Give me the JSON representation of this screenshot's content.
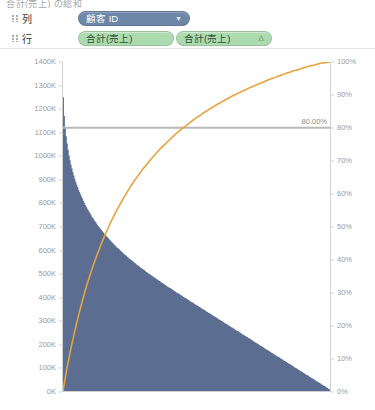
{
  "top_caption": "合計(売上) の総和",
  "shelves": {
    "columns": {
      "label": "列",
      "pills": [
        {
          "text": "顧客 ID",
          "cap": "▼",
          "kind": "blue"
        }
      ]
    },
    "rows": {
      "label": "行",
      "pills": [
        {
          "text": "合計(売上)",
          "cap": "",
          "kind": "green"
        },
        {
          "text": "合計(売上)",
          "cap": "△",
          "kind": "green"
        }
      ]
    }
  },
  "colors": {
    "bar": "#5b6e91",
    "line": "#e8a33d",
    "reference_line": "#b9b9b9",
    "axis_text": "#9a9a9a",
    "pill_blue": "#6e87a8",
    "pill_green": "#addbb0"
  },
  "chart_data": {
    "type": "bar",
    "title": "",
    "subtitle": "",
    "xlabel": "顧客 ID",
    "ylabel": "売上",
    "y2label": "売上の合計の累計(%)",
    "grid": false,
    "legend": "none",
    "ylim": [
      0,
      1400000
    ],
    "y2lim": [
      0,
      1.0
    ],
    "y_ticks": [
      "0K",
      "100K",
      "200K",
      "300K",
      "400K",
      "500K",
      "600K",
      "700K",
      "800K",
      "900K",
      "1000K",
      "1100K",
      "1200K",
      "1300K",
      "1400K"
    ],
    "y_tick_values": [
      0,
      100000,
      200000,
      300000,
      400000,
      500000,
      600000,
      700000,
      800000,
      900000,
      1000000,
      1100000,
      1200000,
      1300000,
      1400000
    ],
    "y2_ticks": [
      "0%",
      "10%",
      "20%",
      "30%",
      "40%",
      "50%",
      "60%",
      "70%",
      "80%",
      "90%",
      "100%"
    ],
    "y2_tick_values": [
      0,
      10,
      20,
      30,
      40,
      50,
      60,
      70,
      80,
      90,
      100
    ],
    "annotations": [
      {
        "text": "80.00%",
        "type": "reference-line",
        "axis": "y2",
        "value": 80
      }
    ],
    "series": [
      {
        "name": "売上",
        "type": "bar",
        "axis": "y",
        "note": "Descending Pareto profile of per-customer sales, normalized 0-1 of max 1400K",
        "values_normalized": [
          0.893,
          0.836,
          0.8,
          0.774,
          0.752,
          0.733,
          0.716,
          0.701,
          0.688,
          0.676,
          0.665,
          0.655,
          0.645,
          0.636,
          0.628,
          0.62,
          0.612,
          0.605,
          0.598,
          0.591,
          0.585,
          0.578,
          0.572,
          0.566,
          0.561,
          0.555,
          0.55,
          0.545,
          0.54,
          0.535,
          0.53,
          0.526,
          0.521,
          0.517,
          0.513,
          0.508,
          0.504,
          0.5,
          0.497,
          0.493,
          0.489,
          0.485,
          0.482,
          0.478,
          0.475,
          0.471,
          0.468,
          0.465,
          0.461,
          0.458,
          0.455,
          0.452,
          0.449,
          0.446,
          0.443,
          0.44,
          0.437,
          0.435,
          0.432,
          0.429,
          0.426,
          0.424,
          0.421,
          0.418,
          0.416,
          0.413,
          0.411,
          0.408,
          0.406,
          0.403,
          0.401,
          0.398,
          0.396,
          0.394,
          0.391,
          0.389,
          0.387,
          0.384,
          0.382,
          0.38,
          0.378,
          0.375,
          0.373,
          0.371,
          0.369,
          0.367,
          0.365,
          0.362,
          0.36,
          0.358,
          0.356,
          0.354,
          0.352,
          0.35,
          0.348,
          0.346,
          0.344,
          0.342,
          0.34,
          0.338,
          0.336,
          0.334,
          0.332,
          0.33,
          0.328,
          0.326,
          0.324,
          0.322,
          0.32,
          0.318,
          0.316,
          0.314,
          0.313,
          0.311,
          0.309,
          0.307,
          0.305,
          0.303,
          0.301,
          0.299,
          0.297,
          0.296,
          0.294,
          0.292,
          0.29,
          0.288,
          0.286,
          0.284,
          0.283,
          0.281,
          0.279,
          0.277,
          0.275,
          0.273,
          0.271,
          0.27,
          0.268,
          0.266,
          0.264,
          0.262,
          0.26,
          0.259,
          0.257,
          0.255,
          0.253,
          0.251,
          0.249,
          0.248,
          0.246,
          0.244,
          0.242,
          0.24,
          0.238,
          0.237,
          0.235,
          0.233,
          0.231,
          0.229,
          0.227,
          0.226,
          0.224,
          0.222,
          0.22,
          0.218,
          0.216,
          0.215,
          0.213,
          0.211,
          0.209,
          0.207,
          0.205,
          0.204,
          0.202,
          0.2,
          0.198,
          0.196,
          0.194,
          0.193,
          0.191,
          0.189,
          0.187,
          0.185,
          0.183,
          0.182,
          0.18,
          0.178,
          0.176,
          0.174,
          0.172,
          0.171,
          0.169,
          0.167,
          0.165,
          0.163,
          0.161,
          0.16,
          0.158,
          0.156,
          0.154,
          0.152,
          0.15,
          0.148,
          0.147,
          0.145,
          0.143,
          0.141,
          0.139,
          0.137,
          0.136,
          0.134,
          0.132,
          0.13,
          0.128,
          0.126,
          0.125,
          0.123,
          0.121,
          0.119,
          0.117,
          0.115,
          0.114,
          0.112,
          0.11,
          0.108,
          0.106,
          0.104,
          0.103,
          0.101,
          0.099,
          0.097,
          0.095,
          0.093,
          0.092,
          0.09,
          0.088,
          0.086,
          0.084,
          0.082,
          0.081,
          0.079,
          0.077,
          0.075,
          0.073,
          0.071,
          0.07,
          0.068,
          0.066,
          0.064,
          0.062,
          0.06,
          0.059,
          0.057,
          0.055,
          0.053,
          0.051,
          0.049,
          0.048,
          0.046,
          0.044,
          0.042,
          0.04,
          0.038,
          0.037,
          0.035,
          0.033,
          0.031,
          0.029,
          0.027,
          0.026,
          0.024,
          0.022,
          0.02,
          0.018,
          0.016,
          0.015,
          0.013,
          0.011,
          0.009,
          0.007,
          0.005
        ]
      },
      {
        "name": "売上の合計の累計(%)",
        "type": "line",
        "axis": "y2",
        "note": "Cumulative percentage curve rising concavely from 0% to 100%",
        "values_percent": [
          0.0,
          4.2,
          8.1,
          11.7,
          15.1,
          18.3,
          21.3,
          24.2,
          26.9,
          29.5,
          32.0,
          34.3,
          36.5,
          38.6,
          40.6,
          42.5,
          44.4,
          46.1,
          47.8,
          49.4,
          51.0,
          52.5,
          53.9,
          55.3,
          56.6,
          57.9,
          59.1,
          60.3,
          61.5,
          62.6,
          63.7,
          64.7,
          65.7,
          66.7,
          67.6,
          68.5,
          69.4,
          70.3,
          71.1,
          71.9,
          72.7,
          73.5,
          74.2,
          74.9,
          75.6,
          76.3,
          77.0,
          77.6,
          78.3,
          78.9,
          79.5,
          80.1,
          80.6,
          81.2,
          81.7,
          82.3,
          82.8,
          83.3,
          83.8,
          84.3,
          84.8,
          85.2,
          85.7,
          86.1,
          86.6,
          87.0,
          87.4,
          87.8,
          88.2,
          88.6,
          89.0,
          89.4,
          89.8,
          90.1,
          90.5,
          90.8,
          91.2,
          91.5,
          91.8,
          92.2,
          92.5,
          92.8,
          93.1,
          93.4,
          93.7,
          94.0,
          94.3,
          94.6,
          94.9,
          95.1,
          95.4,
          95.7,
          95.9,
          96.2,
          96.4,
          96.7,
          96.9,
          97.2,
          97.4,
          97.6,
          97.8,
          98.0,
          98.3,
          98.5,
          98.7,
          98.9,
          99.0,
          99.2,
          99.4,
          99.6,
          99.7,
          99.8,
          99.9,
          100.0
        ]
      }
    ]
  }
}
